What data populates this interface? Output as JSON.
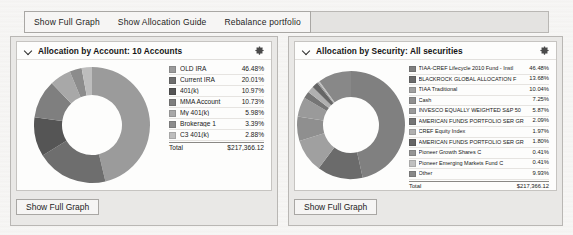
{
  "toolbar": {
    "buttons": [
      {
        "label": "Show Full Graph",
        "name": "show-full-graph-button"
      },
      {
        "label": "Show Allocation Guide",
        "name": "show-allocation-guide-button"
      },
      {
        "label": "Rebalance portfolio",
        "name": "rebalance-portfolio-button"
      }
    ]
  },
  "panels": {
    "accounts": {
      "title": "Allocation by Account:  10 Accounts",
      "footer_button": "Show Full Graph",
      "total_label": "Total",
      "total_value": "$217,366.12"
    },
    "securities": {
      "title": "Allocation by Security:  All securities",
      "footer_button": "Show Full Graph",
      "total_label": "Total",
      "total_value": "$217,366.12"
    }
  },
  "chart_data": [
    {
      "type": "pie",
      "title": "Allocation by Account:  10 Accounts",
      "legend_position": "right",
      "total_label": "Total",
      "total_value": "$217,366.12",
      "categories": [
        "OLD IRA",
        "Current IRA",
        "401(k)",
        "MMA Account",
        "My 401(k)",
        "Brokerage 1",
        "C3 401(k)"
      ],
      "values": [
        46.48,
        20.01,
        10.97,
        10.73,
        5.98,
        3.39,
        2.88
      ],
      "value_labels": [
        "46.48%",
        "20.01%",
        "10.97%",
        "10.73%",
        "5.98%",
        "3.39%",
        "2.88%"
      ],
      "colors": [
        "#9b9b9b",
        "#6e6e6e",
        "#555555",
        "#7f7f7f",
        "#a8a8a8",
        "#8c8c8c",
        "#bdbdbd"
      ]
    },
    {
      "type": "pie",
      "title": "Allocation by Security:  All securities",
      "legend_position": "right",
      "total_label": "Total",
      "total_value": "$217,366.12",
      "categories": [
        "TIAA-CREF Lifecycle 2010 Fund - Instl",
        "BLACKROCK GLOBAL ALLOCATION F",
        "TIAA Traditional",
        "Cash",
        "INVESCO EQUALLY WEIGHTED S&P 50",
        "AMERICAN FUNDS PORTFOLIO SER GR",
        "CREF Equity Index",
        "AMERICAN FUNDS PORTFOLIO SER GR",
        "Pioneer Growth Shares C",
        "Pioneer Emerging Markets Fund C",
        "Other"
      ],
      "values": [
        46.48,
        13.68,
        10.04,
        7.25,
        5.87,
        2.09,
        1.97,
        1.8,
        0.41,
        0.41,
        9.93
      ],
      "value_labels": [
        "46.48%",
        "13.68%",
        "10.04%",
        "7.25%",
        "5.87%",
        "2.09%",
        "1.97%",
        "1.80%",
        "0.41%",
        "0.41%",
        "9.93%"
      ],
      "colors": [
        "#808080",
        "#6b6b6b",
        "#a0a0a0",
        "#8f8f8f",
        "#9a9a9a",
        "#757575",
        "#b0b0b0",
        "#666666",
        "#959595",
        "#c0c0c0",
        "#888888"
      ]
    }
  ],
  "icons": {
    "chevron": "chevron-down-icon",
    "gear": "gear-icon"
  }
}
